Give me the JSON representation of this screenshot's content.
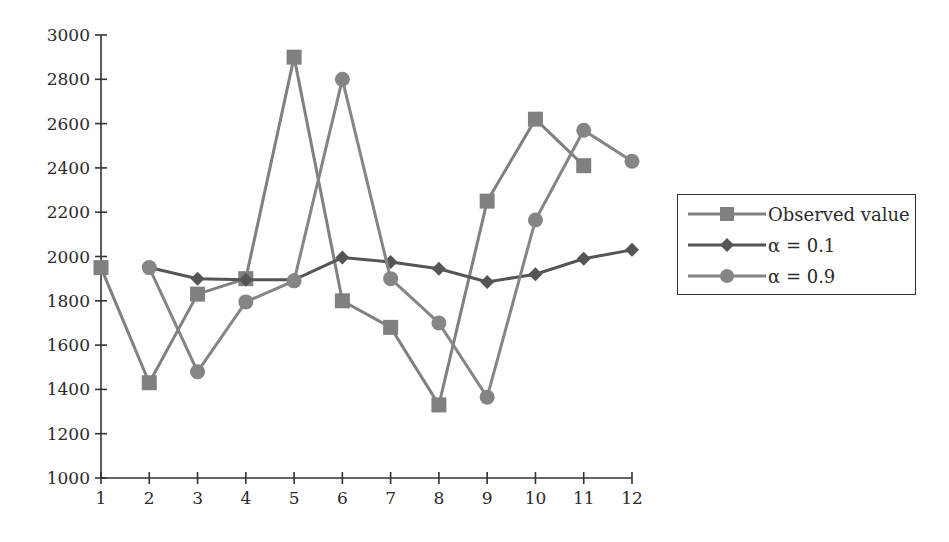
{
  "chart_data": {
    "type": "line",
    "title": "",
    "xlabel": "",
    "ylabel": "",
    "x": [
      1,
      2,
      3,
      4,
      5,
      6,
      7,
      8,
      9,
      10,
      11,
      12
    ],
    "xticks": [
      "1",
      "2",
      "3",
      "4",
      "5",
      "6",
      "7",
      "8",
      "9",
      "10",
      "11",
      "12"
    ],
    "yticks": [
      "1000",
      "1200",
      "1400",
      "1600",
      "1800",
      "2000",
      "2200",
      "2400",
      "2600",
      "2800",
      "3000"
    ],
    "ylim": [
      1000,
      3000
    ],
    "grid": false,
    "legend_position": "right",
    "series": [
      {
        "name": "Observed value",
        "marker": "square",
        "color": "#808080",
        "values": [
          1950,
          1430,
          1830,
          1900,
          2900,
          1800,
          1680,
          1330,
          2250,
          2620,
          2410,
          null
        ]
      },
      {
        "name": "α = 0.1",
        "marker": "diamond",
        "color": "#555555",
        "values": [
          null,
          1950,
          1900,
          1895,
          1895,
          1995,
          1975,
          1945,
          1885,
          1920,
          1990,
          2030
        ]
      },
      {
        "name": "α = 0.9",
        "marker": "circle",
        "color": "#858585",
        "values": [
          null,
          1950,
          1480,
          1795,
          1890,
          2800,
          1900,
          1700,
          1365,
          2165,
          2570,
          2430
        ]
      }
    ]
  },
  "legend": {
    "items": [
      {
        "label": "Observed value"
      },
      {
        "label": "α = 0.1"
      },
      {
        "label": "α = 0.9"
      }
    ]
  }
}
